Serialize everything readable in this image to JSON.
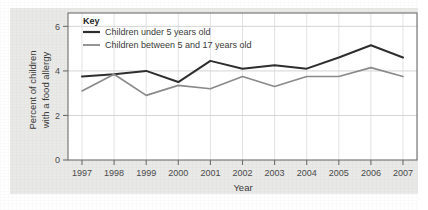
{
  "figure": {
    "background_color": "#e9e9e7",
    "plot_background_color": "#ffffff",
    "frame_color": "#6e6e6e",
    "grid_color": "#c9c9c9"
  },
  "legend": {
    "title": "Key",
    "position": "top-left-inside",
    "entries": [
      {
        "label": "Children under 5 years old",
        "color": "#2e2e2e"
      },
      {
        "label": "Children between 5 and 17 years old",
        "color": "#8a8a8a"
      }
    ]
  },
  "axes": {
    "x": {
      "title": "Year",
      "tick_labels": [
        "1997",
        "1998",
        "1999",
        "2000",
        "2001",
        "2002",
        "2003",
        "2004",
        "2005",
        "2006",
        "2007"
      ]
    },
    "y": {
      "title_line1": "Percent of children",
      "title_line2": "with a food allergy",
      "tick_labels": [
        "0",
        "2",
        "4",
        "6"
      ]
    }
  },
  "chart_data": {
    "type": "line",
    "title": "",
    "xlabel": "Year",
    "ylabel": "Percent of children with a food allergy",
    "categories": [
      "1997",
      "1998",
      "1999",
      "2000",
      "2001",
      "2002",
      "2003",
      "2004",
      "2005",
      "2006",
      "2007"
    ],
    "x": [
      1997,
      1998,
      1999,
      2000,
      2001,
      2002,
      2003,
      2004,
      2005,
      2006,
      2007
    ],
    "xlim": [
      1997,
      2007
    ],
    "ylim": [
      0,
      6.6
    ],
    "yticks": [
      0,
      2,
      4,
      6
    ],
    "grid": true,
    "legend_position": "upper left",
    "series": [
      {
        "name": "Children under 5 years old",
        "color": "#2e2e2e",
        "values": [
          3.75,
          3.85,
          4.0,
          3.5,
          4.45,
          4.1,
          4.25,
          4.1,
          4.6,
          5.15,
          4.6
        ]
      },
      {
        "name": "Children between 5 and 17 years old",
        "color": "#8a8a8a",
        "values": [
          3.1,
          3.85,
          2.9,
          3.35,
          3.2,
          3.75,
          3.3,
          3.75,
          3.75,
          4.15,
          3.75
        ]
      }
    ]
  }
}
